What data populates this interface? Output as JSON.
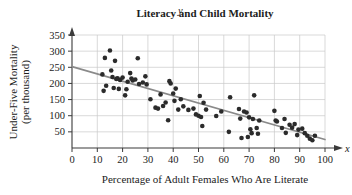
{
  "chart_data": {
    "type": "scatter",
    "title": "Literacy and Child Mortality",
    "xlabel": "Percentage of Adult Females Who Are Literate",
    "ylabel_line1": "Under-Five Mortality",
    "ylabel_line2": "(per thousand)",
    "x_axis_symbol": "x",
    "y_axis_symbol": "y",
    "xlim": [
      0,
      100
    ],
    "ylim": [
      0,
      360
    ],
    "grid": true,
    "legend": "none",
    "x_ticks": [
      0,
      10,
      20,
      30,
      40,
      50,
      60,
      70,
      80,
      90,
      100
    ],
    "y_ticks": [
      50,
      100,
      150,
      200,
      250,
      300,
      350
    ],
    "x_tick_labels": [
      "0",
      "10",
      "20",
      "30",
      "40",
      "50",
      "60",
      "70",
      "80",
      "90",
      "100"
    ],
    "y_tick_labels": [
      "50",
      "100",
      "150",
      "200",
      "250",
      "300",
      "350"
    ],
    "point_color": "#2b2b2b",
    "trend_line_color": "#8a8a8a",
    "grid_color": "#c9c9c9",
    "axis_color": "#3a3a3a",
    "trend_line": {
      "x": [
        0,
        100
      ],
      "y": [
        252,
        26
      ],
      "slope": -2.26,
      "intercept": 252
    },
    "points": [
      [
        12,
        228
      ],
      [
        12.5,
        177
      ],
      [
        13,
        279
      ],
      [
        13.5,
        193
      ],
      [
        15,
        302
      ],
      [
        15.5,
        240
      ],
      [
        16,
        220
      ],
      [
        16.5,
        186
      ],
      [
        17,
        270
      ],
      [
        17.5,
        214
      ],
      [
        18,
        216
      ],
      [
        18.5,
        183
      ],
      [
        19,
        211
      ],
      [
        20,
        218
      ],
      [
        21,
        163
      ],
      [
        21.5,
        182
      ],
      [
        22,
        205
      ],
      [
        23,
        232
      ],
      [
        23.5,
        215
      ],
      [
        24,
        209
      ],
      [
        25,
        212
      ],
      [
        26,
        278
      ],
      [
        26.5,
        198
      ],
      [
        28,
        203
      ],
      [
        29,
        222
      ],
      [
        29.5,
        197
      ],
      [
        31,
        151
      ],
      [
        33,
        125
      ],
      [
        34,
        122
      ],
      [
        35,
        166
      ],
      [
        36,
        130
      ],
      [
        37,
        141
      ],
      [
        38,
        86
      ],
      [
        38.5,
        207
      ],
      [
        39,
        200
      ],
      [
        40,
        169
      ],
      [
        40.5,
        146
      ],
      [
        41,
        184
      ],
      [
        42,
        119
      ],
      [
        43,
        151
      ],
      [
        44,
        129
      ],
      [
        46,
        118
      ],
      [
        48,
        122
      ],
      [
        49,
        104
      ],
      [
        50,
        100
      ],
      [
        50.5,
        161
      ],
      [
        51,
        96
      ],
      [
        51.5,
        68
      ],
      [
        52,
        140
      ],
      [
        53,
        119
      ],
      [
        57,
        99
      ],
      [
        59,
        113
      ],
      [
        62,
        50
      ],
      [
        62.5,
        157
      ],
      [
        66,
        121
      ],
      [
        66.5,
        91
      ],
      [
        67,
        31
      ],
      [
        68,
        113
      ],
      [
        69,
        110
      ],
      [
        69.5,
        34
      ],
      [
        70,
        95
      ],
      [
        70.5,
        58
      ],
      [
        71,
        46
      ],
      [
        71.5,
        90
      ],
      [
        72,
        163
      ],
      [
        73,
        62
      ],
      [
        73.5,
        44
      ],
      [
        74,
        85
      ],
      [
        80,
        115
      ],
      [
        80.5,
        85
      ],
      [
        81,
        82
      ],
      [
        83,
        62
      ],
      [
        84,
        90
      ],
      [
        84.5,
        47
      ],
      [
        86,
        72
      ],
      [
        87,
        63
      ],
      [
        88,
        74
      ],
      [
        89,
        40
      ],
      [
        89.5,
        57
      ],
      [
        91,
        60
      ],
      [
        92,
        46
      ],
      [
        93,
        38
      ],
      [
        94,
        29
      ],
      [
        95,
        24
      ],
      [
        96,
        38
      ]
    ]
  }
}
